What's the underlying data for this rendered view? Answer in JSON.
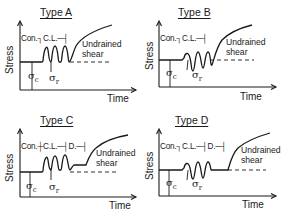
{
  "figure": {
    "axis_labels": {
      "y": "Stress",
      "x": "Time"
    },
    "symbols": {
      "consolidation_stress": "σ",
      "consolidation_sub": "c",
      "cyclic_stress": "σ",
      "cyclic_sub": "r"
    },
    "panels": [
      {
        "id": "A",
        "title": "Type A",
        "phases": [
          "Con.",
          "C.L."
        ],
        "phase_marks": "Con.┐C.L.─┤",
        "end_label": [
          "Undrained",
          "shear"
        ],
        "cyclic_loading": "cycles above baseline",
        "drained_phase": false
      },
      {
        "id": "B",
        "title": "Type B",
        "phases": [
          "Con.",
          "C.L."
        ],
        "phase_marks": "Con.┐C.L.─┤",
        "end_label": [
          "Undrained",
          "shear"
        ],
        "cyclic_loading": "cycles around baseline (two-way)",
        "drained_phase": false
      },
      {
        "id": "C",
        "title": "Type C",
        "phases": [
          "Con.",
          "C.L.",
          "D."
        ],
        "phase_marks": "Con.┼C.L.─┤D.─┤",
        "end_label": [
          "Undrained",
          "shear"
        ],
        "cyclic_loading": "cycles above baseline",
        "drained_phase": true
      },
      {
        "id": "D",
        "title": "Type D",
        "phases": [
          "Con.",
          "C.L.",
          "D."
        ],
        "phase_marks": "Con.┐C.L.─┤D.─┤",
        "end_label": [
          "Undrained",
          "shear"
        ],
        "cyclic_loading": "cycles around baseline (two-way)",
        "drained_phase": true
      }
    ]
  }
}
